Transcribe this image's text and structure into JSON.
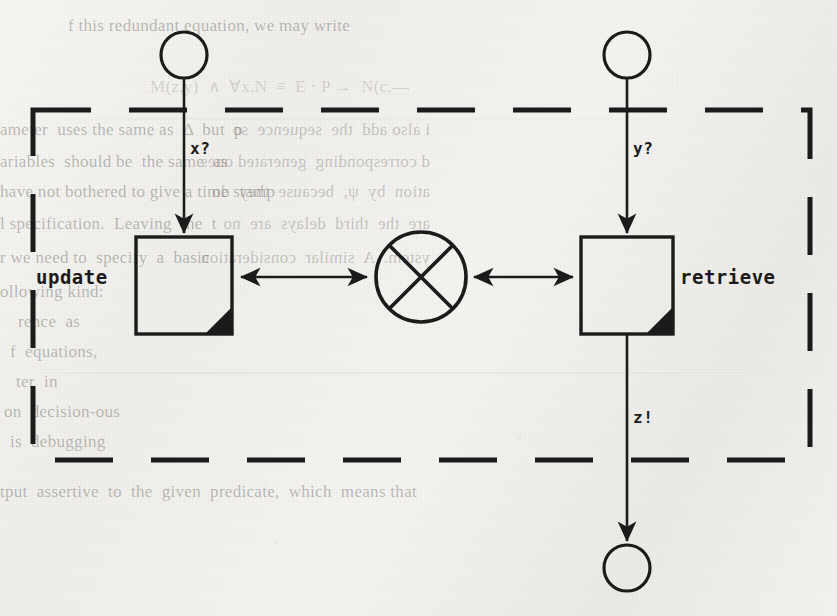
{
  "page": {
    "width": 837,
    "height": 616,
    "background_color": "#f2f1ee",
    "ink_color": "#1b1b1b"
  },
  "diagram": {
    "type": "dataflow-process-diagram",
    "boundary": {
      "name": "system-boundary",
      "style": "dashed-rectangle",
      "x": 33,
      "y": 110,
      "width": 777,
      "height": 350
    },
    "nodes": [
      {
        "id": "in-x",
        "name": "input-terminator-x",
        "shape": "circle",
        "cx": 184,
        "cy": 55,
        "r": 23,
        "label": ""
      },
      {
        "id": "in-y",
        "name": "input-terminator-y",
        "shape": "circle",
        "cx": 627,
        "cy": 55,
        "r": 23,
        "label": ""
      },
      {
        "id": "update",
        "name": "update-process-box",
        "shape": "box-with-corner",
        "x": 136,
        "y": 237,
        "width": 96,
        "height": 97,
        "label": "update",
        "label_side": "left"
      },
      {
        "id": "retrieve",
        "name": "retrieve-process-box",
        "shape": "box-with-corner",
        "x": 581,
        "y": 237,
        "width": 92,
        "height": 97,
        "label": "retrieve",
        "label_side": "right"
      },
      {
        "id": "junction",
        "name": "crossed-circle-junction",
        "shape": "circle-with-x",
        "cx": 421,
        "cy": 277,
        "r": 46,
        "label": ""
      },
      {
        "id": "out-z",
        "name": "output-terminator-z",
        "shape": "circle",
        "cx": 627,
        "cy": 568,
        "r": 23,
        "label": ""
      }
    ],
    "edges": [
      {
        "id": "e-x",
        "name": "edge-x-to-update",
        "from": "in-x",
        "to": "update",
        "label": "x?",
        "label_x": 188,
        "label_y": 140,
        "direction": "down",
        "arrow": "end"
      },
      {
        "id": "e-y",
        "name": "edge-y-to-retrieve",
        "from": "in-y",
        "to": "retrieve",
        "label": "y?",
        "label_x": 631,
        "label_y": 140,
        "direction": "down",
        "arrow": "end"
      },
      {
        "id": "e-z",
        "name": "edge-retrieve-to-z",
        "from": "retrieve",
        "to": "out-z",
        "label": "z!",
        "label_x": 631,
        "label_y": 409,
        "direction": "down",
        "arrow": "end"
      },
      {
        "id": "e-uj",
        "name": "edge-update-junction",
        "from": "update",
        "to": "junction",
        "label": "",
        "direction": "bidirectional",
        "arrow": "both"
      },
      {
        "id": "e-rj",
        "name": "edge-junction-retrieve",
        "from": "junction",
        "to": "retrieve",
        "label": "",
        "direction": "bidirectional",
        "arrow": "both"
      }
    ],
    "labels": {
      "update": "update",
      "retrieve": "retrieve",
      "x": "x?",
      "y": "y?",
      "z": "z!"
    }
  },
  "background_text": {
    "note": "faint show-through text from the scanned book page",
    "lines": [
      {
        "text": "f this redundant equation, we may write",
        "x": 68,
        "y": 16,
        "size": 17,
        "class": "ghost"
      },
      {
        "text": "M(z,y)  ∧  ∀x.N  ≡  E · P →  N(c,—",
        "x": 150,
        "y": 76,
        "size": 17,
        "class": "ghost faint"
      },
      {
        "text": "ameter  uses the same as  Δ  but  p",
        "x": 0,
        "y": 120,
        "size": 17,
        "class": "ghost"
      },
      {
        "text": "ariables  should be  the same  as",
        "x": 0,
        "y": 152,
        "size": 17,
        "class": "ghost"
      },
      {
        "text": "have not bothered to give a time stamp",
        "x": 0,
        "y": 182,
        "size": 17,
        "class": "ghost"
      },
      {
        "text": "l specification.  Leaving  the  t",
        "x": 0,
        "y": 214,
        "size": 17,
        "class": "ghost"
      },
      {
        "text": "r we need to  specify  a  basic",
        "x": 0,
        "y": 248,
        "size": 17,
        "class": "ghost"
      },
      {
        "text": "ollowing kind:",
        "x": 0,
        "y": 282,
        "size": 17,
        "class": "ghost"
      },
      {
        "text": "rence  as",
        "x": 18,
        "y": 312,
        "size": 17,
        "class": "ghost"
      },
      {
        "text": "f  equations,",
        "x": 10,
        "y": 342,
        "size": 17,
        "class": "ghost"
      },
      {
        "text": "ter  in",
        "x": 16,
        "y": 372,
        "size": 17,
        "class": "ghost"
      },
      {
        "text": "on  decision-ous",
        "x": 4,
        "y": 402,
        "size": 17,
        "class": "ghost"
      },
      {
        "text": "is  debugging",
        "x": 10,
        "y": 432,
        "size": 17,
        "class": "ghost"
      },
      {
        "text": "tput  assertive  to  the  given  predicate,  which  means that",
        "x": 0,
        "y": 482,
        "size": 17,
        "class": "ghost"
      },
      {
        "text": "i also add  the  sequence  so",
        "x": 430,
        "y": 120,
        "size": 17,
        "class": "ghost flip"
      },
      {
        "text": "d corresponding  generated ones",
        "x": 430,
        "y": 152,
        "size": 17,
        "class": "ghost flip"
      },
      {
        "text": "ation  by  ψ,  because  they  do",
        "x": 430,
        "y": 182,
        "size": 17,
        "class": "ghost flip"
      },
      {
        "text": "are  the  third  delays  are  no",
        "x": 430,
        "y": 214,
        "size": 17,
        "class": "ghost flip"
      },
      {
        "text": "ystem.  A  similar  consideration",
        "x": 430,
        "y": 248,
        "size": 17,
        "class": "ghost flip"
      }
    ]
  }
}
